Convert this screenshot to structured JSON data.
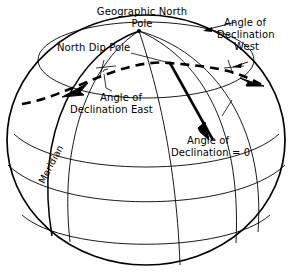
{
  "figure": {
    "title_alt": "Magnetic declination on a globe",
    "stroke_color": "#000000",
    "background_color": "#ffffff",
    "labels": {
      "geographic_north_pole": "Geographic North\nPole",
      "geographic_north_pole_line1": "Geographic North",
      "geographic_north_pole_line2": "Pole",
      "north_dip_pole": "North Dip Pole",
      "angle_declination_west_line1": "Angle of",
      "angle_declination_west_line2": "Declination",
      "angle_declination_west_line3": "West",
      "angle_declination_east_line1": "Angle of",
      "angle_declination_east_line2": "Declination East",
      "angle_declination_zero_line1": "Angle of",
      "angle_declination_zero_line2": "Declination = 0",
      "meridian": "Meridian"
    }
  }
}
